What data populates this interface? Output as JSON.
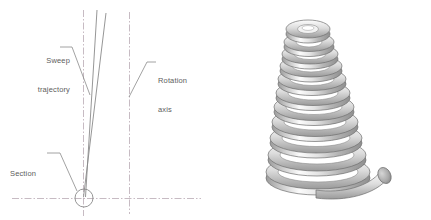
{
  "figure": {
    "kind": "cad-sweep-illustration",
    "background_color": "#ffffff"
  },
  "diagram": {
    "title_labels": {
      "sweep": {
        "line1": "Sweep",
        "line2": "trajectory"
      },
      "rotation": {
        "line1": "Rotation",
        "line2": "axis"
      },
      "section": {
        "line1": "Section"
      }
    },
    "colors": {
      "centerline": "#b9a9b4",
      "geometry": "#8a8a8a",
      "leader": "#8a8a8a",
      "text": "#5d5d5d"
    },
    "elements": [
      {
        "name": "sweep-axis-centerline",
        "type": "vertical-centerline",
        "x": 83,
        "y1": 10,
        "y2": 215
      },
      {
        "name": "rotation-axis-centerline",
        "type": "vertical-centerline",
        "x": 129,
        "y1": 12,
        "y2": 213
      },
      {
        "name": "base-plane-centerline",
        "type": "horizontal-centerline",
        "y": 198,
        "x1": 12,
        "x2": 201
      },
      {
        "name": "sweep-trajectory-line",
        "type": "polyline",
        "points": "85,197 97,10"
      },
      {
        "name": "sweep-trajectory-line-secondary",
        "type": "polyline",
        "points": "84,197 106,12"
      },
      {
        "name": "section-circle",
        "type": "circle",
        "cx": 84,
        "cy": 198,
        "r": 9
      }
    ],
    "leaders": [
      {
        "name": "sweep-leader",
        "from_label": "sweep",
        "points": "60,47 72,47 90,95"
      },
      {
        "name": "rotation-leader",
        "from_label": "rotation",
        "points": "155,62 147,62 129,97"
      },
      {
        "name": "section-leader",
        "from_label": "section",
        "points": "47,153 60,153 77,191"
      }
    ]
  },
  "render": {
    "object_name": "conical-coil-spring",
    "coil_count": 11,
    "shading": {
      "highlight": "#fdfdfd",
      "midtone": "#d2d2d2",
      "shadow": "#8d8d8d",
      "outline": "#6f6f6f",
      "cut_face": "#a8a8a8"
    },
    "top_radius_x": 28,
    "bottom_radius_x": 52,
    "top_y": 20,
    "bottom_y": 196
  }
}
